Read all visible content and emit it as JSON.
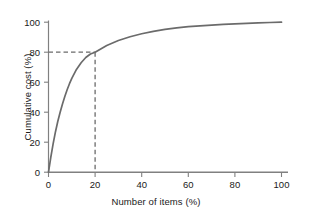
{
  "chart_data": {
    "type": "line",
    "title": "",
    "subtitle": "",
    "xlabel": "Number of items (%)",
    "ylabel": "Cumulative cost (%)",
    "xlim": [
      0,
      100
    ],
    "ylim": [
      0,
      100
    ],
    "xticks": [
      0,
      20,
      40,
      60,
      80,
      100
    ],
    "yticks": [
      0,
      20,
      40,
      60,
      80,
      100
    ],
    "xtick_labels": [
      "0",
      "20",
      "40",
      "60",
      "80",
      "100"
    ],
    "ytick_labels": [
      "0",
      "20",
      "40",
      "60",
      "80",
      "100"
    ],
    "grid": false,
    "legend": false,
    "legend_position": "none",
    "series": [
      {
        "name": "Cumulative cost curve",
        "color": "#6b6b6b",
        "style": "solid",
        "x": [
          0,
          1,
          2,
          3,
          4,
          5,
          6,
          7,
          8,
          9,
          10,
          12,
          14,
          16,
          18,
          20,
          25,
          30,
          35,
          40,
          45,
          50,
          55,
          60,
          65,
          70,
          75,
          80,
          85,
          90,
          95,
          100
        ],
        "values": [
          0,
          10,
          19,
          27,
          34,
          40,
          45.5,
          50.5,
          55,
          59,
          62.5,
          68.5,
          73,
          76.5,
          78.8,
          80,
          84.5,
          87.8,
          90.3,
          92.3,
          93.9,
          95.2,
          96.2,
          97.0,
          97.6,
          98.1,
          98.5,
          98.9,
          99.2,
          99.5,
          99.8,
          100
        ]
      }
    ],
    "annotations": [
      {
        "name": "eighty-twenty-guide",
        "type": "dashed-crosshair",
        "x": 20,
        "y": 80,
        "color": "#6b6b6b",
        "description": "Dashed lines marking 20% of items accounting for 80% of cumulative cost"
      }
    ],
    "axis_color": "#808080",
    "text_color": "#1a1a1a"
  }
}
